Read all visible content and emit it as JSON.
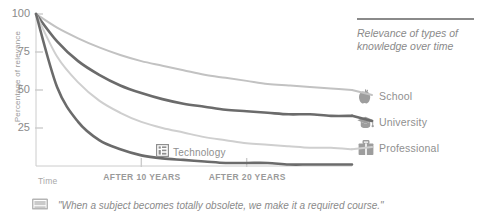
{
  "title": {
    "text": "Relevance of types of knowledge over time"
  },
  "caption": {
    "icon": "book-icon",
    "text": "\"When a subject becomes totally obsolete, we make it a required course.\""
  },
  "inline_label": {
    "icon": "technology-icon",
    "text": "Technology"
  },
  "legend": {
    "items": [
      {
        "label": "School",
        "icon": "apple-icon",
        "color": "#c2c2c2"
      },
      {
        "label": "University",
        "icon": "graduation-cap-icon",
        "color": "#6b6b6b"
      },
      {
        "label": "Professional",
        "icon": "briefcase-icon",
        "color": "#cfcfcf"
      }
    ]
  },
  "chart_data": {
    "type": "line",
    "title": "Relevance of types of knowledge over time",
    "xlabel": "Time",
    "ylabel": "Percentage of relevance",
    "ylim": [
      0,
      100
    ],
    "xlim": [
      0,
      30
    ],
    "yticks": [
      100,
      75,
      50,
      25
    ],
    "ytick_labels": [
      "100",
      "75",
      "50",
      "25"
    ],
    "xticks": [
      10,
      20
    ],
    "xtick_labels": [
      "AFTER 10 YEARS",
      "AFTER 20 YEARS"
    ],
    "grid": false,
    "legend_position": "right",
    "x": [
      0,
      2,
      4,
      6,
      8,
      10,
      12,
      14,
      16,
      18,
      20,
      22,
      24,
      26,
      28,
      30
    ],
    "series": [
      {
        "name": "School",
        "color": "#c2c2c2",
        "width": 2.0,
        "values": [
          100,
          91,
          84,
          78,
          73,
          69,
          66,
          63,
          60,
          58,
          56,
          54,
          53,
          52,
          51,
          50
        ]
      },
      {
        "name": "University",
        "color": "#6b6b6b",
        "width": 2.6,
        "values": [
          100,
          82,
          69,
          60,
          53,
          48,
          44,
          41,
          39,
          37,
          36,
          35,
          34,
          34,
          33,
          33
        ]
      },
      {
        "name": "Professional",
        "color": "#cfcfcf",
        "width": 2.0,
        "values": [
          100,
          72,
          55,
          43,
          35,
          29,
          25,
          22,
          19,
          17,
          15,
          14,
          13,
          12,
          12,
          11
        ]
      },
      {
        "name": "Technology",
        "color": "#6b6b6b",
        "width": 2.6,
        "values": [
          100,
          52,
          29,
          17,
          11,
          7,
          5,
          4,
          3,
          2,
          2,
          2,
          1,
          1,
          1,
          1
        ]
      }
    ]
  },
  "colors": {
    "axis": "#cccccc",
    "text": "#8f8f8f",
    "dark_line": "#6b6b6b",
    "mid_line": "#c2c2c2",
    "light_line": "#cfcfcf"
  }
}
